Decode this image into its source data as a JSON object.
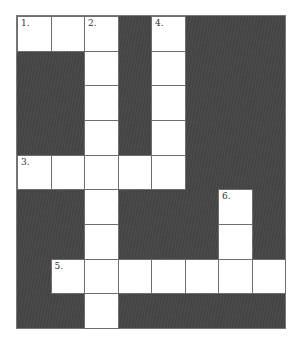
{
  "puzzle": {
    "rows": 9,
    "cols": 8,
    "cell_width": 33.75,
    "cell_height": 34.9,
    "colors": {
      "block": "#454545",
      "cell": "#ffffff",
      "line": "#6e6e6e"
    },
    "cells": [
      {
        "r": 0,
        "c": 0,
        "num": "1."
      },
      {
        "r": 0,
        "c": 1
      },
      {
        "r": 0,
        "c": 2,
        "num": "2."
      },
      {
        "r": 0,
        "c": 4,
        "num": "4."
      },
      {
        "r": 1,
        "c": 2
      },
      {
        "r": 1,
        "c": 4
      },
      {
        "r": 2,
        "c": 2
      },
      {
        "r": 2,
        "c": 4
      },
      {
        "r": 3,
        "c": 2
      },
      {
        "r": 3,
        "c": 4
      },
      {
        "r": 4,
        "c": 0,
        "num": "3."
      },
      {
        "r": 4,
        "c": 1
      },
      {
        "r": 4,
        "c": 2
      },
      {
        "r": 4,
        "c": 3
      },
      {
        "r": 4,
        "c": 4
      },
      {
        "r": 5,
        "c": 2
      },
      {
        "r": 5,
        "c": 6,
        "num": "6."
      },
      {
        "r": 6,
        "c": 2
      },
      {
        "r": 6,
        "c": 6
      },
      {
        "r": 7,
        "c": 1,
        "num": "5."
      },
      {
        "r": 7,
        "c": 2
      },
      {
        "r": 7,
        "c": 3
      },
      {
        "r": 7,
        "c": 4
      },
      {
        "r": 7,
        "c": 5
      },
      {
        "r": 7,
        "c": 6
      },
      {
        "r": 7,
        "c": 7
      },
      {
        "r": 8,
        "c": 2
      }
    ],
    "entries": {
      "across": [
        {
          "number": "1",
          "row": 0,
          "col": 0,
          "length": 3
        },
        {
          "number": "3",
          "row": 4,
          "col": 0,
          "length": 5
        },
        {
          "number": "5",
          "row": 7,
          "col": 1,
          "length": 7
        }
      ],
      "down": [
        {
          "number": "2",
          "row": 0,
          "col": 2,
          "length": 9
        },
        {
          "number": "4",
          "row": 0,
          "col": 4,
          "length": 5
        },
        {
          "number": "6",
          "row": 5,
          "col": 6,
          "length": 3
        }
      ]
    }
  }
}
